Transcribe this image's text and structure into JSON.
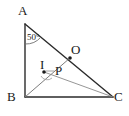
{
  "figure": {
    "type": "geometry-diagram",
    "background_color": "#ffffff",
    "stroke_color": "#2b2b2b",
    "thin_stroke_color": "#8a8a8a",
    "label_color": "#1a1a1a",
    "vertices": {
      "A": {
        "label": "A",
        "x": 24,
        "y": 16
      },
      "B": {
        "label": "B",
        "x": 24,
        "y": 97
      },
      "C": {
        "label": "C",
        "x": 113,
        "y": 97
      },
      "O": {
        "label": "O",
        "x": 70,
        "y": 54
      },
      "I": {
        "label": "I",
        "x": 44,
        "y": 71
      },
      "P": {
        "label": "P",
        "x": 57,
        "y": 72
      }
    },
    "labels": {
      "A": "A",
      "B": "B",
      "C": "C",
      "O": "O",
      "I": "I",
      "P": "P"
    },
    "angle_marks": [
      {
        "name": "angle-at-A",
        "vertex": "A",
        "value": "50°",
        "label_x": 27,
        "label_y": 33
      },
      {
        "name": "angle-at-I",
        "vertex": "I",
        "value": ""
      }
    ],
    "segments": [
      {
        "name": "segment-AB",
        "from": "A",
        "to": "B",
        "weight": "thick"
      },
      {
        "name": "segment-AC",
        "from": "A",
        "to": "C",
        "weight": "thick"
      },
      {
        "name": "segment-BC",
        "from": "B",
        "to": "C",
        "weight": "thick"
      },
      {
        "name": "segment-BO",
        "from": "B",
        "to": "O",
        "weight": "thin"
      },
      {
        "name": "segment-IC",
        "from": "I",
        "to": "C",
        "weight": "thin"
      }
    ],
    "points_marked": [
      "O",
      "I"
    ]
  }
}
